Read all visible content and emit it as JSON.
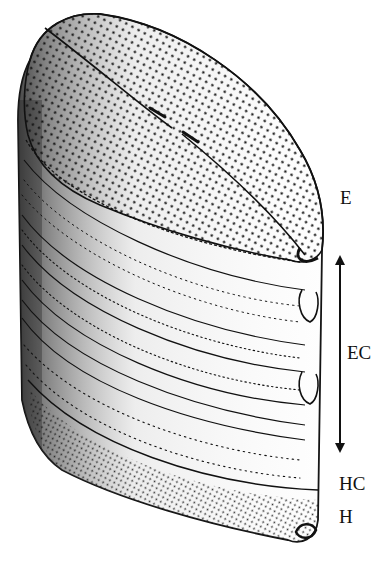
{
  "figure": {
    "background": "#ffffff",
    "ink": "#111111"
  },
  "labels": {
    "E": {
      "text": "E",
      "x": 340,
      "y": 190
    },
    "EC": {
      "text": "EC",
      "x": 346,
      "y": 345
    },
    "HC": {
      "text": "HC",
      "x": 339,
      "y": 476
    },
    "H": {
      "text": "H",
      "x": 339,
      "y": 509
    }
  },
  "arrow": {
    "x": 340,
    "y_top": 258,
    "y_bottom": 448,
    "type": "double-headed"
  }
}
